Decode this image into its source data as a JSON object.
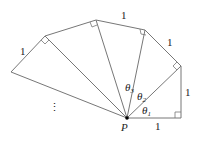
{
  "diagram": {
    "type": "spiral-of-right-triangles",
    "point_label": "P",
    "points": {
      "P": [
        127,
        118
      ],
      "A0": [
        181,
        118
      ],
      "A1": [
        181,
        66
      ],
      "A2": [
        145,
        30
      ],
      "A3": [
        96,
        20
      ],
      "A4": [
        45,
        36
      ],
      "A5": [
        11,
        72
      ]
    },
    "side_labels": [
      "1",
      "1",
      "1",
      "1",
      "1"
    ],
    "angle_labels": [
      {
        "name": "θ",
        "sub": "1"
      },
      {
        "name": "θ",
        "sub": "2"
      },
      {
        "name": "θ",
        "sub": "3"
      }
    ],
    "ellipsis": "⋮",
    "colors": {
      "line": "#777777",
      "text": "#222222",
      "point": "#000000"
    }
  }
}
